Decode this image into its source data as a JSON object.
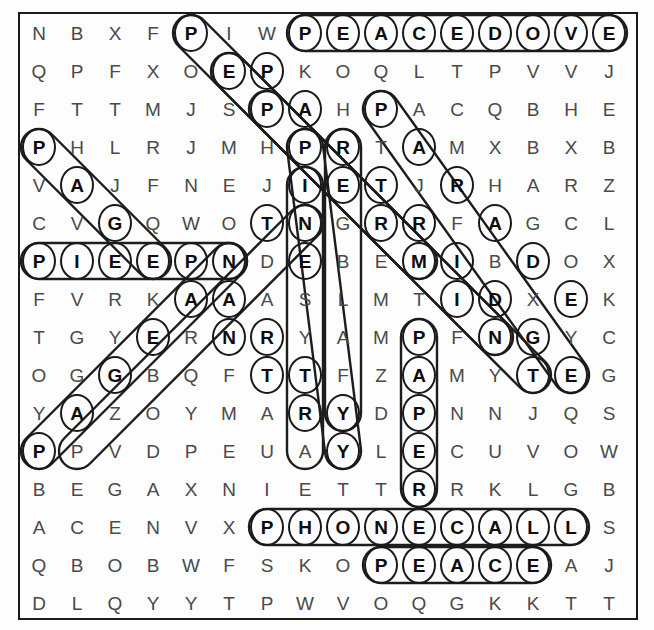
{
  "puzzle": {
    "type": "word-search",
    "rows": 16,
    "cols": 16,
    "cell_size": 38,
    "ink_color": "#1b1b1b",
    "plain_letter_color": "#4a4a4a",
    "marked_letter_color": "#0d0d0d",
    "grid": [
      [
        "N",
        "B",
        "X",
        "F",
        "P",
        "I",
        "W",
        "P",
        "E",
        "A",
        "C",
        "E",
        "D",
        "O",
        "V",
        "E"
      ],
      [
        "Q",
        "P",
        "F",
        "X",
        "O",
        "E",
        "P",
        "K",
        "O",
        "Q",
        "L",
        "T",
        "P",
        "V",
        "V",
        "J"
      ],
      [
        "F",
        "T",
        "T",
        "M",
        "J",
        "S",
        "P",
        "A",
        "H",
        "P",
        "A",
        "C",
        "Q",
        "B",
        "H",
        "E"
      ],
      [
        "P",
        "H",
        "L",
        "R",
        "J",
        "M",
        "H",
        "P",
        "R",
        "T",
        "A",
        "M",
        "X",
        "B",
        "X",
        "B"
      ],
      [
        "V",
        "A",
        "J",
        "F",
        "N",
        "E",
        "J",
        "I",
        "E",
        "T",
        "J",
        "R",
        "H",
        "A",
        "R",
        "Z"
      ],
      [
        "C",
        "V",
        "G",
        "Q",
        "W",
        "O",
        "T",
        "N",
        "G",
        "R",
        "R",
        "F",
        "A",
        "G",
        "C",
        "L"
      ],
      [
        "P",
        "I",
        "E",
        "E",
        "P",
        "N",
        "D",
        "E",
        "B",
        "E",
        "M",
        "I",
        "B",
        "D",
        "O",
        "X"
      ],
      [
        "F",
        "V",
        "R",
        "K",
        "A",
        "A",
        "A",
        "S",
        "L",
        "M",
        "T",
        "I",
        "D",
        "X",
        "E",
        "K"
      ],
      [
        "T",
        "G",
        "Y",
        "E",
        "R",
        "N",
        "R",
        "Y",
        "A",
        "M",
        "P",
        "F",
        "N",
        "G",
        "Y",
        "C"
      ],
      [
        "O",
        "G",
        "G",
        "B",
        "Q",
        "F",
        "T",
        "T",
        "F",
        "Z",
        "A",
        "M",
        "Y",
        "T",
        "E",
        "G"
      ],
      [
        "Y",
        "A",
        "Z",
        "O",
        "Y",
        "M",
        "A",
        "R",
        "Y",
        "D",
        "P",
        "N",
        "N",
        "J",
        "Q",
        "S"
      ],
      [
        "P",
        "P",
        "V",
        "D",
        "P",
        "E",
        "U",
        "A",
        "Y",
        "L",
        "E",
        "C",
        "U",
        "V",
        "O",
        "W"
      ],
      [
        "B",
        "E",
        "G",
        "A",
        "X",
        "N",
        "I",
        "E",
        "T",
        "T",
        "R",
        "R",
        "K",
        "L",
        "G",
        "B"
      ],
      [
        "A",
        "C",
        "E",
        "N",
        "V",
        "X",
        "P",
        "H",
        "O",
        "N",
        "E",
        "C",
        "A",
        "L",
        "L",
        "S"
      ],
      [
        "Q",
        "B",
        "O",
        "B",
        "W",
        "F",
        "S",
        "K",
        "O",
        "P",
        "E",
        "A",
        "C",
        "E",
        "A",
        "J"
      ],
      [
        "D",
        "L",
        "Q",
        "Y",
        "Y",
        "T",
        "P",
        "W",
        "V",
        "O",
        "Q",
        "G",
        "K",
        "K",
        "T",
        "T"
      ]
    ],
    "circled": [
      [
        0,
        4
      ],
      [
        0,
        7
      ],
      [
        0,
        8
      ],
      [
        0,
        9
      ],
      [
        0,
        10
      ],
      [
        0,
        11
      ],
      [
        0,
        12
      ],
      [
        0,
        13
      ],
      [
        0,
        14
      ],
      [
        0,
        15
      ],
      [
        1,
        5
      ],
      [
        1,
        6
      ],
      [
        2,
        6
      ],
      [
        2,
        7
      ],
      [
        2,
        9
      ],
      [
        3,
        0
      ],
      [
        3,
        7
      ],
      [
        3,
        8
      ],
      [
        3,
        10
      ],
      [
        4,
        1
      ],
      [
        4,
        7
      ],
      [
        4,
        8
      ],
      [
        4,
        9
      ],
      [
        4,
        11
      ],
      [
        5,
        2
      ],
      [
        5,
        6
      ],
      [
        5,
        7
      ],
      [
        5,
        9
      ],
      [
        5,
        10
      ],
      [
        5,
        12
      ],
      [
        6,
        0
      ],
      [
        6,
        1
      ],
      [
        6,
        2
      ],
      [
        6,
        3
      ],
      [
        6,
        4
      ],
      [
        6,
        5
      ],
      [
        6,
        7
      ],
      [
        6,
        10
      ],
      [
        6,
        11
      ],
      [
        6,
        13
      ],
      [
        7,
        4
      ],
      [
        7,
        5
      ],
      [
        7,
        11
      ],
      [
        7,
        12
      ],
      [
        7,
        14
      ],
      [
        8,
        3
      ],
      [
        8,
        5
      ],
      [
        8,
        6
      ],
      [
        8,
        10
      ],
      [
        8,
        12
      ],
      [
        8,
        13
      ],
      [
        9,
        2
      ],
      [
        9,
        6
      ],
      [
        9,
        7
      ],
      [
        9,
        10
      ],
      [
        9,
        13
      ],
      [
        9,
        14
      ],
      [
        10,
        1
      ],
      [
        10,
        7
      ],
      [
        10,
        8
      ],
      [
        10,
        10
      ],
      [
        11,
        0
      ],
      [
        11,
        8
      ],
      [
        11,
        10
      ],
      [
        12,
        10
      ],
      [
        13,
        6
      ],
      [
        13,
        7
      ],
      [
        13,
        8
      ],
      [
        13,
        9
      ],
      [
        13,
        10
      ],
      [
        13,
        11
      ],
      [
        13,
        12
      ],
      [
        13,
        13
      ],
      [
        13,
        14
      ],
      [
        14,
        9
      ],
      [
        14,
        10
      ],
      [
        14,
        11
      ],
      [
        14,
        12
      ],
      [
        14,
        13
      ]
    ],
    "found_words": [
      {
        "word": "PEACE DOVE",
        "direction": "horizontal",
        "start_row": 0,
        "start_col": 7
      },
      {
        "word": "PHONE CALL",
        "direction": "horizontal",
        "start_row": 13,
        "start_col": 6
      },
      {
        "word": "PEACE",
        "direction": "horizontal",
        "start_row": 14,
        "start_col": 9
      },
      {
        "word": "PIE EPN",
        "direction": "horizontal",
        "start_row": 6,
        "start_col": 0
      },
      {
        "word": "PAPER",
        "direction": "vertical",
        "start_row": 8,
        "start_col": 10
      },
      {
        "word": "PEPPERMINT",
        "direction": "diagonal-down-right",
        "start_row": 0,
        "start_col": 4
      },
      {
        "word": "PARTRIDGE",
        "direction": "diagonal-down-right",
        "start_row": 2,
        "start_col": 9
      },
      {
        "word": "PAGE",
        "direction": "diagonal-down-right",
        "start_row": 3,
        "start_col": 0
      },
      {
        "word": "PRETTY",
        "direction": "diagonal-down-right",
        "start_row": 3,
        "start_col": 7
      },
      {
        "word": "PAINTER",
        "direction": "diagonal-down-right",
        "start_row": 3,
        "start_col": 8
      },
      {
        "word": "PAGEANTRY",
        "direction": "diagonal-up-right",
        "start_row": 11,
        "start_col": 0
      }
    ]
  }
}
